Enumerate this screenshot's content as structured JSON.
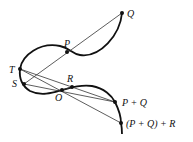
{
  "diagram": {
    "colors": {
      "curve": "#111111",
      "line": "#333333",
      "point": "#111111"
    },
    "points": [
      {
        "id": "Q",
        "label": "Q",
        "x": 122,
        "y": 13,
        "lx": 127,
        "ly": 17
      },
      {
        "id": "P",
        "label": "P",
        "x": 67,
        "y": 52,
        "lx": 64,
        "ly": 47
      },
      {
        "id": "T",
        "label": "T",
        "x": 20,
        "y": 69,
        "lx": 9,
        "ly": 73
      },
      {
        "id": "S",
        "label": "S",
        "x": 24,
        "y": 84,
        "lx": 12,
        "ly": 87
      },
      {
        "id": "O",
        "label": "O",
        "x": 62,
        "y": 90,
        "lx": 55,
        "ly": 101
      },
      {
        "id": "R",
        "label": "R",
        "x": 72,
        "y": 87,
        "lx": 67,
        "ly": 82
      },
      {
        "id": "PQ",
        "label": "P + Q",
        "x": 115,
        "y": 102,
        "lx": 122,
        "ly": 106
      },
      {
        "id": "PQR",
        "label": "(P + Q) + R",
        "x": 121,
        "y": 123,
        "lx": 126,
        "ly": 127
      }
    ],
    "lines": [
      {
        "from": "S",
        "to": "Q"
      },
      {
        "from": "S",
        "to": "PQ"
      },
      {
        "from": "T",
        "to": "PQ"
      },
      {
        "from": "T",
        "to": "PQR"
      },
      {
        "from": "O",
        "to": "R"
      }
    ]
  }
}
